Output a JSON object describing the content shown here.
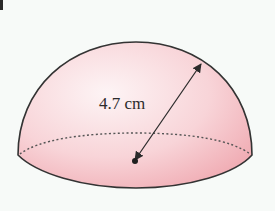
{
  "figure": {
    "type": "hemisphere",
    "label": "4.7 cm",
    "measurement": {
      "value": 4.7,
      "unit": "cm",
      "meaning": "radius"
    },
    "colors": {
      "fill_light": "#fdf1f2",
      "fill_dark": "#f2aeb5",
      "outline": "#333333",
      "background": "#f7faf8"
    }
  }
}
